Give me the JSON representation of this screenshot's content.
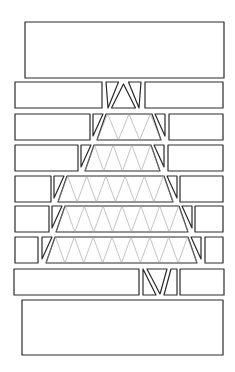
{
  "diagram": {
    "type": "line-art pattern",
    "colors": {
      "background": "#ffffff",
      "stroke": "#2a2a2a",
      "inner_stroke": "#9a9a9a"
    },
    "panels": [
      {
        "name": "top-box",
        "x": 25,
        "y": 22,
        "w": 199,
        "h": 56
      },
      {
        "name": "bottom-box",
        "x": 22,
        "y": 300,
        "w": 201,
        "h": 55
      }
    ],
    "rows": [
      {
        "y": 82,
        "h": 26,
        "left": [
          15,
          102
        ],
        "center": [
          106,
          141
        ],
        "right": [
          145,
          223
        ],
        "triangles": 1
      },
      {
        "y": 114,
        "h": 26,
        "left": [
          15,
          90
        ],
        "center": [
          93,
          165
        ],
        "right": [
          169,
          223
        ],
        "triangles": 3
      },
      {
        "y": 145,
        "h": 26,
        "left": [
          15,
          78
        ],
        "center": [
          81,
          164
        ],
        "right": [
          168,
          223
        ],
        "triangles": 4
      },
      {
        "y": 176,
        "h": 26,
        "left": [
          15,
          51
        ],
        "center": [
          54,
          177
        ],
        "right": [
          180,
          223
        ],
        "triangles": 6
      },
      {
        "y": 206,
        "h": 26,
        "left": [
          15,
          49
        ],
        "center": [
          52,
          192
        ],
        "right": [
          195,
          223
        ],
        "triangles": 7
      },
      {
        "y": 237,
        "h": 26,
        "left": [
          15,
          38
        ],
        "center": [
          42,
          201
        ],
        "right": [
          205,
          223
        ],
        "triangles": 8
      },
      {
        "y": 269,
        "h": 26,
        "left": [
          14,
          139
        ],
        "center": [
          143,
          177
        ],
        "right": [
          180,
          224
        ],
        "triangles": 1
      }
    ]
  }
}
